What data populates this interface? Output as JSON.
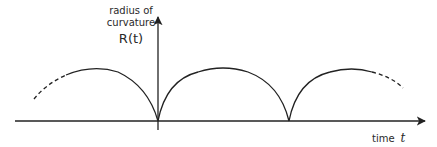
{
  "diagram": {
    "y_axis": {
      "label_line1": "radius of",
      "label_line2": "curvature",
      "symbol": "R(t)"
    },
    "x_axis": {
      "label": "time",
      "symbol": "t"
    },
    "curve": {
      "description": "Periodic arches (cycloid-like radius of curvature) touching zero at cusps",
      "cusp_count": 2,
      "full_arches": 2,
      "partial_arches_dashed": 2
    },
    "colors": {
      "stroke": "#222222",
      "background": "#ffffff"
    }
  }
}
